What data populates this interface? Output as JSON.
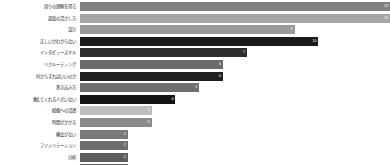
{
  "chart_data": {
    "type": "bar",
    "orientation": "horizontal",
    "title": "",
    "xlabel": "",
    "ylabel": "",
    "grid": false,
    "legend": false,
    "xlim": [
      0,
      13
    ],
    "categories": [
      "周りの理解を得る",
      "調査の活かし方",
      "設計",
      "正しいかわからない",
      "インタビュースキル",
      "リクルーティング",
      "何からすればいいのか",
      "巻き込み方",
      "教えてくれる人がいない",
      "組織への浸透",
      "時間がかかる",
      "機会がない",
      "ファシリテーション",
      "分析",
      "定量データ"
    ],
    "values": [
      13,
      13,
      9,
      10,
      7,
      6,
      6,
      5,
      4,
      3,
      3,
      2,
      2,
      2,
      2
    ],
    "bar_colors": [
      "#808080",
      "#a6a6a6",
      "#9a9a9a",
      "#1a1a1a",
      "#2e2e2e",
      "#6b6b6b",
      "#1f1f1f",
      "#6f6f6f",
      "#141414",
      "#bdbdbd",
      "#8a8a8a",
      "#7a7a7a",
      "#6e6e6e",
      "#5e5e5e",
      "#5a5a5a"
    ],
    "value_labels": [
      "13",
      "13",
      "9",
      "10",
      "7",
      "6",
      "6",
      "5",
      "4",
      "3",
      "3",
      "2",
      "2",
      "2",
      "2"
    ],
    "background_color": "#ffffff",
    "label_color": "#1f1f1f"
  }
}
